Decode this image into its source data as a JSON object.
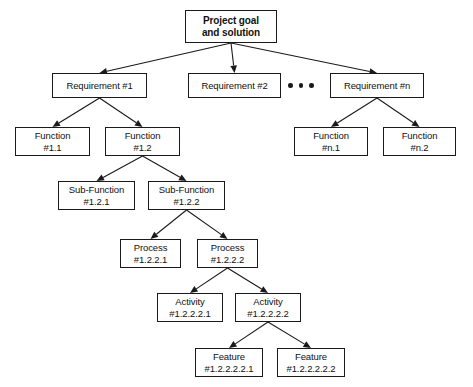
{
  "diagram": {
    "colors": {
      "stroke": "#1a1a1a",
      "fill": "#ffffff",
      "text": "#111111"
    },
    "ellipsis": {
      "name": "ellipsis-dots",
      "dot_count": 3
    },
    "nodes": [
      {
        "id": "root",
        "name": "node-project-goal",
        "line1": "Project goal",
        "line2": "and solution",
        "x": 185,
        "y": 10,
        "w": 92,
        "h": 33,
        "bold": true
      },
      {
        "id": "req1",
        "name": "node-requirement-1",
        "line1": "Requirement #1",
        "line2": "",
        "x": 52,
        "y": 73,
        "w": 95,
        "h": 25,
        "bold": false
      },
      {
        "id": "req2",
        "name": "node-requirement-2",
        "line1": "Requirement #2",
        "line2": "",
        "x": 188,
        "y": 73,
        "w": 93,
        "h": 25,
        "bold": false
      },
      {
        "id": "reqn",
        "name": "node-requirement-n",
        "line1": "Requirement #n",
        "line2": "",
        "x": 330,
        "y": 73,
        "w": 94,
        "h": 25,
        "bold": false
      },
      {
        "id": "fn11",
        "name": "node-function-1-1",
        "line1": "Function",
        "line2": "#1.1",
        "x": 15,
        "y": 127,
        "w": 75,
        "h": 29,
        "bold": false
      },
      {
        "id": "fn12",
        "name": "node-function-1-2",
        "line1": "Function",
        "line2": "#1.2",
        "x": 105,
        "y": 127,
        "w": 75,
        "h": 29,
        "bold": false
      },
      {
        "id": "fnn1",
        "name": "node-function-n-1",
        "line1": "Function",
        "line2": "#n.1",
        "x": 294,
        "y": 127,
        "w": 74,
        "h": 29,
        "bold": false
      },
      {
        "id": "fnn2",
        "name": "node-function-n-2",
        "line1": "Function",
        "line2": "#n.2",
        "x": 383,
        "y": 127,
        "w": 73,
        "h": 29,
        "bold": false
      },
      {
        "id": "sf121",
        "name": "node-sub-function-1-2-1",
        "line1": "Sub-Function",
        "line2": "#1.2.1",
        "x": 58,
        "y": 181,
        "w": 77,
        "h": 29,
        "bold": false
      },
      {
        "id": "sf122",
        "name": "node-sub-function-1-2-2",
        "line1": "Sub-Function",
        "line2": "#1.2.2",
        "x": 148,
        "y": 181,
        "w": 77,
        "h": 29,
        "bold": false
      },
      {
        "id": "pr1221",
        "name": "node-process-1-2-2-1",
        "line1": "Process",
        "line2": "#1.2.2.1",
        "x": 120,
        "y": 239,
        "w": 61,
        "h": 29,
        "bold": false
      },
      {
        "id": "pr1222",
        "name": "node-process-1-2-2-2",
        "line1": "Process",
        "line2": "#1.2.2.2",
        "x": 197,
        "y": 239,
        "w": 61,
        "h": 29,
        "bold": false
      },
      {
        "id": "ac12221",
        "name": "node-activity-1-2-2-2-1",
        "line1": "Activity",
        "line2": "#1.2.2.2.1",
        "x": 157,
        "y": 293,
        "w": 66,
        "h": 29,
        "bold": false
      },
      {
        "id": "ac12222",
        "name": "node-activity-1-2-2-2-2",
        "line1": "Activity",
        "line2": "#1.2.2.2.2",
        "x": 235,
        "y": 293,
        "w": 66,
        "h": 29,
        "bold": false
      },
      {
        "id": "ft1222221",
        "name": "node-feature-1-2-2-2-2-1",
        "line1": "Feature",
        "line2": "#1.2.2.2.2.1",
        "x": 195,
        "y": 348,
        "w": 68,
        "h": 29,
        "bold": false
      },
      {
        "id": "ft1222222",
        "name": "node-feature-1-2-2-2-2-2",
        "line1": "Feature",
        "line2": "#1.2.2.2.2.2",
        "x": 277,
        "y": 348,
        "w": 68,
        "h": 29,
        "bold": false
      }
    ],
    "edges": [
      {
        "name": "edge-root-to-requirement-1",
        "from": "root",
        "to": "req1"
      },
      {
        "name": "edge-root-to-requirement-2",
        "from": "root",
        "to": "req2"
      },
      {
        "name": "edge-root-to-requirement-n",
        "from": "root",
        "to": "reqn"
      },
      {
        "name": "edge-requirement-1-to-function-1-1",
        "from": "req1",
        "to": "fn11"
      },
      {
        "name": "edge-requirement-1-to-function-1-2",
        "from": "req1",
        "to": "fn12"
      },
      {
        "name": "edge-requirement-n-to-function-n-1",
        "from": "reqn",
        "to": "fnn1"
      },
      {
        "name": "edge-requirement-n-to-function-n-2",
        "from": "reqn",
        "to": "fnn2"
      },
      {
        "name": "edge-function-1-2-to-sub-1-2-1",
        "from": "fn12",
        "to": "sf121"
      },
      {
        "name": "edge-function-1-2-to-sub-1-2-2",
        "from": "fn12",
        "to": "sf122"
      },
      {
        "name": "edge-sub-1-2-2-to-process-1",
        "from": "sf122",
        "to": "pr1221"
      },
      {
        "name": "edge-sub-1-2-2-to-process-2",
        "from": "sf122",
        "to": "pr1222"
      },
      {
        "name": "edge-process-2-to-activity-1",
        "from": "pr1222",
        "to": "ac12221"
      },
      {
        "name": "edge-process-2-to-activity-2",
        "from": "pr1222",
        "to": "ac12222"
      },
      {
        "name": "edge-activity-2-to-feature-1",
        "from": "ac12222",
        "to": "ft1222221"
      },
      {
        "name": "edge-activity-2-to-feature-2",
        "from": "ac12222",
        "to": "ft1222222"
      }
    ],
    "ellipsis_pos": {
      "x": 288,
      "y": 83
    }
  }
}
